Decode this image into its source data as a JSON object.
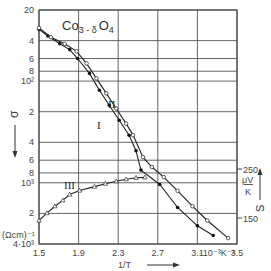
{
  "chart_data": {
    "type": "line",
    "title_main": "Co",
    "title_sub": "3 - δ",
    "title_tail": "O",
    "title_tail_sub": "4",
    "xlabel": "1/T",
    "xunit": "·10⁻³K⁻¹",
    "ylabel_left": "σ",
    "yunit_left": "(Ωcm)⁻¹",
    "ylabel_right": "S",
    "yunit_right_num": "μV",
    "yunit_right_den": "K",
    "x_ticks": [
      "1.5",
      "1.9",
      "2.3",
      "2.7",
      "3.1",
      "3.5"
    ],
    "x_tick_values": [
      1.5,
      1.9,
      2.3,
      2.7,
      3.1,
      3.5
    ],
    "xlim": [
      1.5,
      3.5
    ],
    "y_left_scale": "log",
    "y_left_ticks": [
      "20",
      "4",
      "6",
      "8",
      "10²",
      "2",
      "4",
      "6",
      "8",
      "10³",
      "2",
      "4·10³"
    ],
    "y_left_tick_values": [
      20,
      40,
      60,
      80,
      100,
      200,
      400,
      600,
      800,
      1000,
      2000,
      4000
    ],
    "ylim_left": [
      20,
      4000
    ],
    "y_left_inverted": true,
    "y_right_ticks": [
      "250",
      "150"
    ],
    "y_right_tick_values": [
      250,
      150
    ],
    "grid": true,
    "series": [
      {
        "name": "I",
        "marker": "filled-circle",
        "axis": "left",
        "x": [
          1.5,
          1.59,
          1.71,
          1.81,
          1.89,
          2.01,
          2.11,
          2.21,
          2.31,
          2.41,
          2.48,
          2.53,
          2.72,
          2.9,
          3.1,
          3.26
        ],
        "y": [
          31,
          36,
          43,
          49,
          60,
          84,
          123,
          173,
          243,
          341,
          484,
          750,
          1040,
          1750,
          2650,
          3300
        ]
      },
      {
        "name": "II",
        "marker": "open-circle",
        "axis": "left",
        "x": [
          1.5,
          1.62,
          1.76,
          1.88,
          1.98,
          2.08,
          2.18,
          2.28,
          2.38,
          2.45,
          2.55,
          2.64,
          2.76,
          2.9,
          3.05,
          3.2,
          3.41
        ],
        "y": [
          30,
          37,
          43,
          51,
          67,
          94,
          132,
          186,
          262,
          340,
          560,
          700,
          880,
          1200,
          1700,
          2350,
          3500
        ]
      },
      {
        "name": "III",
        "marker": "open-triangle",
        "axis": "right",
        "unit": "μV/K",
        "x": [
          1.5,
          1.58,
          1.66,
          1.74,
          1.81,
          1.91,
          2.06,
          2.17,
          2.28,
          2.38,
          2.48,
          2.57
        ],
        "y": [
          145,
          160,
          174,
          186,
          198,
          206,
          214,
          220,
          225,
          229,
          232,
          233
        ]
      }
    ],
    "annotations": [
      "I",
      "II",
      "III"
    ]
  }
}
